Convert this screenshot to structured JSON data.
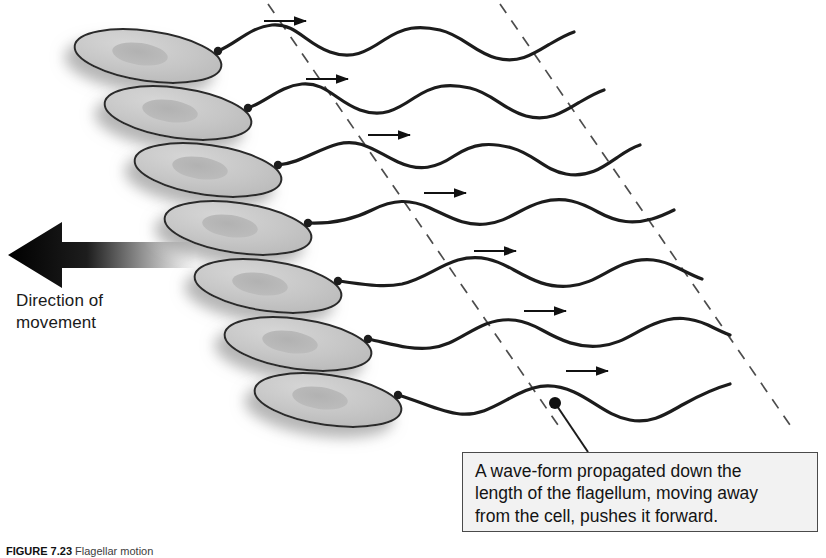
{
  "figure": {
    "domain": "diagram",
    "background_color": "#ffffff",
    "width": 826,
    "height": 558
  },
  "direction_arrow": {
    "label_line1": "Direction of",
    "label_line2": "movement",
    "points_to": "left",
    "gradient_from": "#000000",
    "gradient_to": "#ffffff",
    "tip_x": 8,
    "tail_x": 196,
    "center_y": 255
  },
  "callout": {
    "line1": "A wave-form propagated down the",
    "line2": "length of the flagellum, moving away",
    "line3": "from the cell, pushes it forward.",
    "border_color": "#4a4a4a",
    "fill_color": "#f2f2f2",
    "leader_dot_x": 555,
    "leader_dot_y": 403
  },
  "caption": {
    "figure_number": "FIGURE 7.23",
    "text": "Flagellar motion"
  },
  "style": {
    "cell_fill": "#c9c9c9",
    "cell_stroke": "#2b2b2b",
    "nucleoid_fill": "#b3b3b3",
    "flagellum_stroke": "#1c1c1c",
    "dashed_line_stroke": "#4d4d4d",
    "arrow_stroke": "#111111",
    "shadow_color": "#b8b8b8"
  },
  "diagram": {
    "row_count": 7,
    "row_dy": 57.5,
    "row_dx": 24,
    "first_cell_cx": 148,
    "first_cell_cy": 56,
    "cell_rx": 74,
    "cell_ry": 25,
    "cell_tilt_deg": 8,
    "wave_amplitude": 21,
    "wave_length": 152,
    "wave_phase_shift_deg": 68,
    "flagellum_length": 400,
    "dashed_lines": [
      {
        "x_top": 268,
        "y_top": 6,
        "x_bottom": 560,
        "y_bottom": 424
      },
      {
        "x_top": 500,
        "y_top": 6,
        "x_bottom": 790,
        "y_bottom": 424
      }
    ],
    "arrow_marks": [
      {
        "row": 1,
        "x": 268,
        "y": 22
      },
      {
        "row": 2,
        "x": 310,
        "y": 80
      },
      {
        "row": 3,
        "x": 372,
        "y": 136
      },
      {
        "row": 4,
        "x": 428,
        "y": 194
      },
      {
        "row": 5,
        "x": 478,
        "y": 252
      },
      {
        "row": 6,
        "x": 528,
        "y": 312
      },
      {
        "row": 7,
        "x": 570,
        "y": 372
      }
    ],
    "arrow_mark_length": 44,
    "rows": [
      {
        "index": 1,
        "cell_cx": 148,
        "cell_cy": 56,
        "flagellum_start_x": 218,
        "flagellum_start_y": 50
      },
      {
        "index": 2,
        "cell_cx": 178,
        "cell_cy": 113,
        "flagellum_start_x": 248,
        "flagellum_start_y": 107
      },
      {
        "index": 3,
        "cell_cx": 208,
        "cell_cy": 170,
        "flagellum_start_x": 278,
        "flagellum_start_y": 164
      },
      {
        "index": 4,
        "cell_cx": 238,
        "cell_cy": 228,
        "flagellum_start_x": 308,
        "flagellum_start_y": 222
      },
      {
        "index": 5,
        "cell_cx": 268,
        "cell_cy": 286,
        "flagellum_start_x": 338,
        "flagellum_start_y": 280
      },
      {
        "index": 6,
        "cell_cx": 298,
        "cell_cy": 344,
        "flagellum_start_x": 368,
        "flagellum_start_y": 338
      },
      {
        "index": 7,
        "cell_cx": 328,
        "cell_cy": 400,
        "flagellum_start_x": 398,
        "flagellum_start_y": 394
      }
    ]
  }
}
